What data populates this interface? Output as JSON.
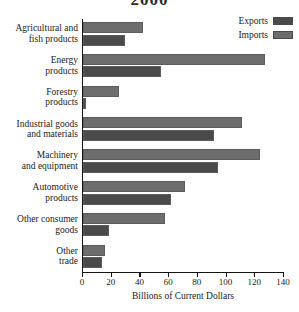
{
  "chart_data": {
    "type": "bar",
    "orientation": "horizontal",
    "title": "2000",
    "title_cropped": true,
    "xlabel": "Billions of Current Dollars",
    "ylabel": "",
    "xlim": [
      0,
      140
    ],
    "xticks": [
      0,
      20,
      40,
      60,
      80,
      100,
      120,
      140
    ],
    "grid": false,
    "legend_position": "top-right",
    "categories": [
      "Agricultural and fish products",
      "Energy products",
      "Forestry products",
      "Industrial goods and materials",
      "Machinery and equipment",
      "Automotive products",
      "Other consumer goods",
      "Other trade"
    ],
    "category_lines": [
      [
        "Agricultural and",
        "fish products"
      ],
      [
        "Energy",
        "products"
      ],
      [
        "Forestry",
        "products"
      ],
      [
        "Industrial goods",
        "and materials"
      ],
      [
        "Machinery",
        "and equipment"
      ],
      [
        "Automotive",
        "products"
      ],
      [
        "Other consumer",
        "goods"
      ],
      [
        "Other",
        "trade"
      ]
    ],
    "series": [
      {
        "name": "Imports",
        "color": "#6d6d6d",
        "values": [
          42,
          127,
          25,
          111,
          123,
          71,
          57,
          15
        ]
      },
      {
        "name": "Exports",
        "color": "#4a4a4a",
        "values": [
          29,
          54,
          2,
          91,
          94,
          61,
          18,
          13
        ]
      }
    ]
  },
  "legend": {
    "entries": [
      {
        "label": "Exports",
        "swatch": "exports"
      },
      {
        "label": "Imports",
        "swatch": "imports"
      }
    ]
  },
  "axis": {
    "tick_labels": [
      "0",
      "20",
      "40",
      "60",
      "80",
      "100",
      "120",
      "140"
    ],
    "x_title": "Billions of Current Dollars"
  }
}
